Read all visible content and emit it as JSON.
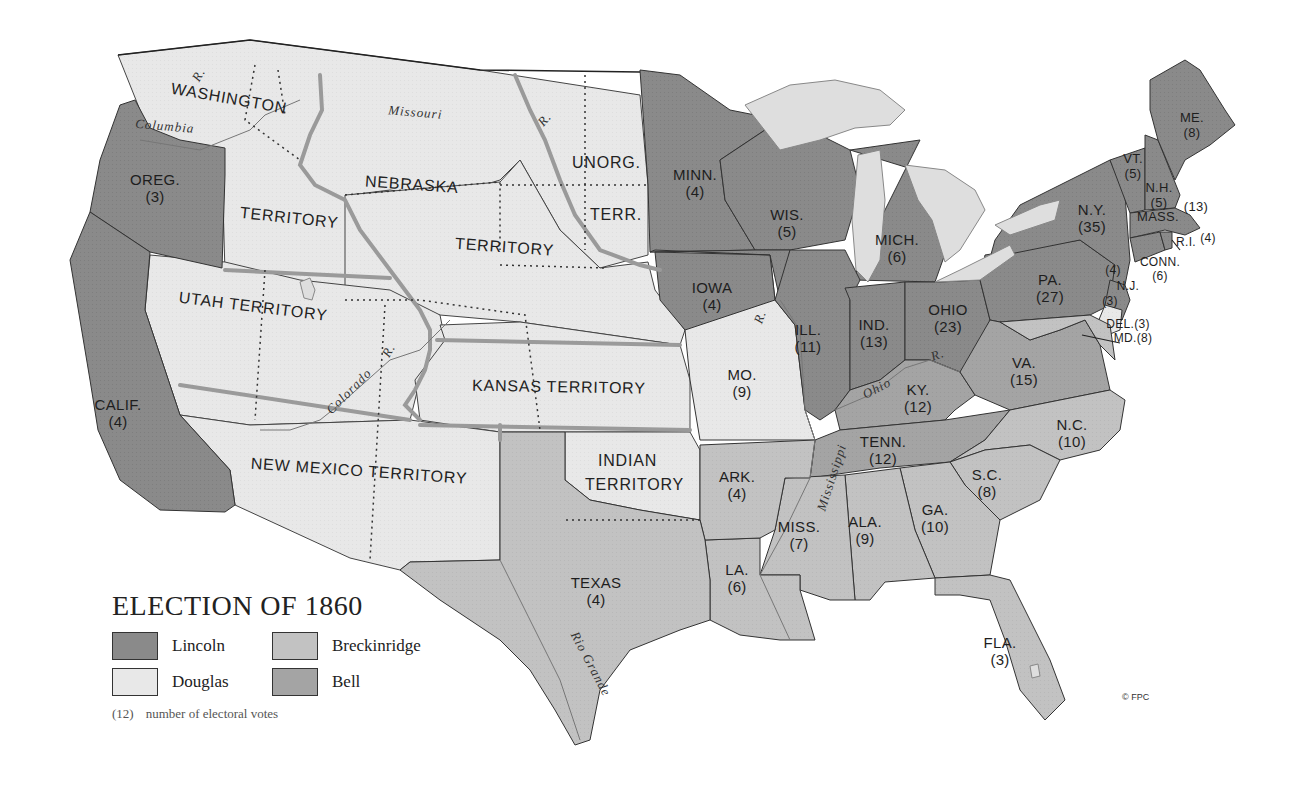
{
  "title": "ELECTION OF 1860",
  "colors": {
    "lincoln": "#8a8a8a",
    "douglas": "#e8e8e8",
    "breckinridge": "#c2c2c2",
    "bell": "#a4a4a4",
    "lake": "#dcdcdc",
    "border": "#222222",
    "river": "#9a9a9a"
  },
  "legend": {
    "items": [
      {
        "key": "lincoln",
        "label": "Lincoln"
      },
      {
        "key": "breckinridge",
        "label": "Breckinridge"
      },
      {
        "key": "douglas",
        "label": "Douglas"
      },
      {
        "key": "bell",
        "label": "Bell"
      }
    ],
    "note_example": "(12)",
    "note_text": "number of electoral votes"
  },
  "states": [
    {
      "abbr": "OREG.",
      "votes": "(3)",
      "candidate": "lincoln"
    },
    {
      "abbr": "CALIF.",
      "votes": "(4)",
      "candidate": "lincoln"
    },
    {
      "abbr": "MINN.",
      "votes": "(4)",
      "candidate": "lincoln"
    },
    {
      "abbr": "WIS.",
      "votes": "(5)",
      "candidate": "lincoln"
    },
    {
      "abbr": "IOWA",
      "votes": "(4)",
      "candidate": "lincoln"
    },
    {
      "abbr": "MICH.",
      "votes": "(6)",
      "candidate": "lincoln"
    },
    {
      "abbr": "ILL.",
      "votes": "(11)",
      "candidate": "lincoln"
    },
    {
      "abbr": "IND.",
      "votes": "(13)",
      "candidate": "lincoln"
    },
    {
      "abbr": "OHIO",
      "votes": "(23)",
      "candidate": "lincoln"
    },
    {
      "abbr": "PA.",
      "votes": "(27)",
      "candidate": "lincoln"
    },
    {
      "abbr": "N.Y.",
      "votes": "(35)",
      "candidate": "lincoln"
    },
    {
      "abbr": "VT.",
      "votes": "(5)",
      "candidate": "lincoln"
    },
    {
      "abbr": "N.H.",
      "votes": "(5)",
      "candidate": "lincoln"
    },
    {
      "abbr": "ME.",
      "votes": "(8)",
      "candidate": "lincoln"
    },
    {
      "abbr": "MASS.",
      "votes": "(13)",
      "candidate": "lincoln"
    },
    {
      "abbr": "R.I.",
      "votes": "(4)",
      "candidate": "lincoln"
    },
    {
      "abbr": "CONN.",
      "votes": "(6)",
      "candidate": "lincoln"
    },
    {
      "abbr": "N.J.",
      "votes": "(4)",
      "candidate": "lincoln",
      "split_votes": "(3)",
      "split_candidate": "douglas"
    },
    {
      "abbr": "MO.",
      "votes": "(9)",
      "candidate": "douglas"
    },
    {
      "abbr": "KY.",
      "votes": "(12)",
      "candidate": "bell"
    },
    {
      "abbr": "TENN.",
      "votes": "(12)",
      "candidate": "bell"
    },
    {
      "abbr": "VA.",
      "votes": "(15)",
      "candidate": "bell"
    },
    {
      "abbr": "DEL.",
      "votes": "(3)",
      "candidate": "breckinridge"
    },
    {
      "abbr": "MD.",
      "votes": "(8)",
      "candidate": "breckinridge"
    },
    {
      "abbr": "N.C.",
      "votes": "(10)",
      "candidate": "breckinridge"
    },
    {
      "abbr": "S.C.",
      "votes": "(8)",
      "candidate": "breckinridge"
    },
    {
      "abbr": "GA.",
      "votes": "(10)",
      "candidate": "breckinridge"
    },
    {
      "abbr": "FLA.",
      "votes": "(3)",
      "candidate": "breckinridge"
    },
    {
      "abbr": "ALA.",
      "votes": "(9)",
      "candidate": "breckinridge"
    },
    {
      "abbr": "MISS.",
      "votes": "(7)",
      "candidate": "breckinridge"
    },
    {
      "abbr": "LA.",
      "votes": "(6)",
      "candidate": "breckinridge"
    },
    {
      "abbr": "ARK.",
      "votes": "(4)",
      "candidate": "breckinridge"
    },
    {
      "abbr": "TEXAS",
      "votes": "(4)",
      "candidate": "breckinridge"
    }
  ],
  "territories": {
    "washington": "WASHINGTON",
    "washington_2": "TERRITORY",
    "nebraska": "NEBRASKA",
    "nebraska_2": "TERRITORY",
    "unorg": "UNORG.",
    "unorg_2": "TERR.",
    "utah": "UTAH TERRITORY",
    "kansas": "KANSAS TERRITORY",
    "new_mexico": "NEW MEXICO TERRITORY",
    "indian": "INDIAN",
    "indian_2": "TERRITORY"
  },
  "rivers": {
    "columbia": "Columbia",
    "columbia_r": "R.",
    "missouri": "Missouri",
    "missouri_r": "R.",
    "colorado": "Colorado",
    "colorado_r": "R.",
    "mississippi": "Mississippi",
    "mississippi_r": "R.",
    "ohio": "Ohio",
    "ohio_r": "R.",
    "rio_grande": "Rio Grande"
  },
  "copyright": "© FPC"
}
